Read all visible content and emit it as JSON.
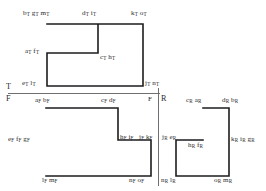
{
  "figure": {
    "title": "",
    "background_color": "#ffffff",
    "stroke_color": "#1d1d1f",
    "divider_color": "#6f6f72",
    "text_color": "#2b2b2d",
    "width": 266,
    "height": 191
  },
  "regions": [
    {
      "tag": "T",
      "tag_x": 8,
      "tag_y": 84,
      "shape": "notched-rectangle",
      "outline_points": "47,24 143,24 143,86 47,86 47,53 98,53 98,24",
      "labels": [
        {
          "id": "t-b-g-m",
          "text": "b",
          "subs": "T",
          "extra": "g_T m_T",
          "html": "b<sub>T</sub> g<sub>T</sub> m<sub>T</sub>",
          "x": 23,
          "y": 10
        },
        {
          "id": "t-d-i",
          "html": "d<sub>T</sub> i<sub>T</sub>",
          "x": 82,
          "y": 10
        },
        {
          "id": "t-k-o",
          "html": "k<sub>T</sub> o<sub>T</sub>",
          "x": 131,
          "y": 10
        },
        {
          "id": "t-a-f",
          "html": "a<sub>T</sub> f<sub>T</sub>",
          "x": 25,
          "y": 48
        },
        {
          "id": "t-c-h",
          "html": "c<sub>T</sub> h<sub>T</sub>",
          "x": 100,
          "y": 54
        },
        {
          "id": "t-e-l",
          "html": "e<sub>T</sub> l<sub>T</sub>",
          "x": 22,
          "y": 80
        },
        {
          "id": "t-j-n",
          "html": "j<sub>T</sub> n<sub>T</sub>",
          "x": 145,
          "y": 80
        }
      ]
    },
    {
      "tag": "F",
      "tag_x": 8,
      "tag_y": 96,
      "shape": "inverted-L",
      "outline_points": "46,108 118,108 118,140 151,140 151,176 46,176",
      "labels": [
        {
          "id": "f-a-b",
          "html": "a<sub>F</sub> b<sub>F</sub>",
          "x": 35,
          "y": 97
        },
        {
          "id": "f-c-d",
          "html": "c<sub>F</sub> d<sub>F</sub>",
          "x": 101,
          "y": 97
        },
        {
          "id": "f-e-f-g",
          "html": "e<sub>F</sub> f<sub>F</sub> g<sub>F</sub>",
          "x": 8,
          "y": 136
        },
        {
          "id": "f-h-i",
          "html": "h<sub>F</sub> i<sub>F</sub>",
          "x": 120,
          "y": 134
        },
        {
          "id": "f-j-k",
          "html": "j<sub>F</sub> k<sub>F</sub>",
          "x": 139,
          "y": 134
        },
        {
          "id": "f-l-m",
          "html": "l<sub>F</sub> m<sub>F</sub>",
          "x": 42,
          "y": 177
        },
        {
          "id": "f-n-o",
          "html": "n<sub>F</sub> o<sub>F</sub>",
          "x": 129,
          "y": 177
        },
        {
          "id": "f-corner",
          "html": "F",
          "x": 148,
          "y": 96
        }
      ]
    },
    {
      "tag": "R",
      "tag_x": 162,
      "tag_y": 96,
      "shape": "T-shape",
      "outline_points": "203,108 229,108 229,140 229,176 176,176 176,140 203,140",
      "labels": [
        {
          "id": "r-c-a",
          "html": "c<sub>R</sub> a<sub>R</sub>",
          "x": 186,
          "y": 97
        },
        {
          "id": "r-d-b",
          "html": "d<sub>R</sub> b<sub>R</sub>",
          "x": 222,
          "y": 97
        },
        {
          "id": "r-j-e",
          "html": "j<sub>R</sub> e<sub>R</sub>",
          "x": 162,
          "y": 134
        },
        {
          "id": "r-h-f",
          "html": "h<sub>R</sub> f<sub>R</sub>",
          "x": 188,
          "y": 142
        },
        {
          "id": "r-k-i-g",
          "html": "k<sub>R</sub> i<sub>R</sub> g<sub>R</sub>",
          "x": 231,
          "y": 136
        },
        {
          "id": "r-n-l",
          "html": "n<sub>R</sub> l<sub>R</sub>",
          "x": 161,
          "y": 177
        },
        {
          "id": "r-o-m",
          "html": "o<sub>R</sub> m<sub>R</sub>",
          "x": 214,
          "y": 177
        }
      ]
    }
  ],
  "dividers": {
    "horizontal": {
      "x1": 8,
      "y1": 93,
      "x2": 160,
      "y2": 93
    },
    "vertical": {
      "x1": 158,
      "y1": 88,
      "x2": 158,
      "y2": 186
    }
  }
}
